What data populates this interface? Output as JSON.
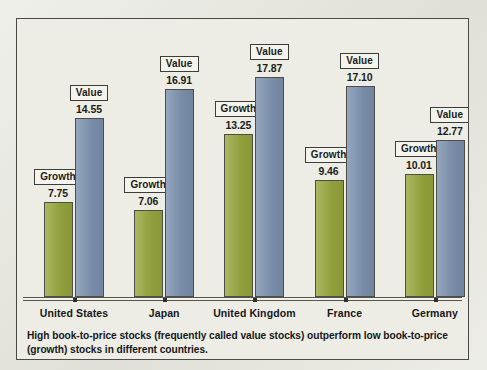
{
  "caption": "High book-to-price stocks (frequently called value stocks) outperform low book-to-price (growth) stocks in different countries.",
  "legend": {
    "growth_label": "Growth",
    "value_label": "Value"
  },
  "colors": {
    "growth": "#99a83e",
    "value": "#7e93b0",
    "page_background": "#e7e7df",
    "plot_background": "#edede5",
    "frame_border": "#4a4a46",
    "text": "#17171a"
  },
  "chart_data": {
    "type": "bar",
    "title": "",
    "subtitle": "",
    "xlabel": "",
    "ylabel": "",
    "ylim": [
      0,
      19
    ],
    "grid": false,
    "legend_position": "inline-labels",
    "categories": [
      "United States",
      "Japan",
      "United Kingdom",
      "France",
      "Germany"
    ],
    "series": [
      {
        "name": "Growth",
        "color": "#99a83e",
        "values": [
          7.75,
          7.06,
          13.25,
          9.46,
          10.01
        ],
        "value_labels": [
          "7.75",
          "7.06",
          "13.25",
          "9.46",
          "10.01"
        ]
      },
      {
        "name": "Value",
        "color": "#7e93b0",
        "values": [
          14.55,
          16.91,
          17.87,
          17.1,
          12.77
        ],
        "value_labels": [
          "14.55",
          "16.91",
          "17.87",
          "17.10",
          "12.77"
        ]
      }
    ]
  }
}
